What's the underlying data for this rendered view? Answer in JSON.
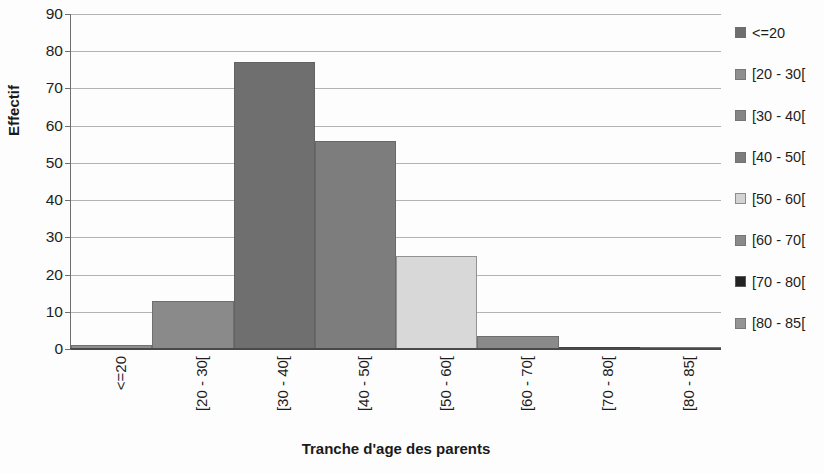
{
  "chart_data": {
    "type": "bar",
    "title": "",
    "xlabel": "Tranche d'age des parents",
    "ylabel": "Effectif",
    "categories": [
      "<=20",
      "[20 - 30[",
      "[30 - 40[",
      "[40 - 50[",
      "[50 - 60[",
      "[60 - 70[",
      "[70 - 80[",
      "[80 - 85["
    ],
    "values": [
      1,
      13,
      77,
      56,
      25,
      3.5,
      0.5,
      0
    ],
    "ylim": [
      0,
      90
    ],
    "ytick_labels": [
      "90",
      "80",
      "70",
      "60",
      "50",
      "40",
      "30",
      "20",
      "10",
      "0"
    ],
    "ytick_values": [
      90,
      80,
      70,
      60,
      50,
      40,
      30,
      20,
      10,
      0
    ],
    "ytick_step": 10,
    "grid": true,
    "grid_axis": "y",
    "legend_position": "right",
    "bar_gap": 0,
    "series": [
      {
        "name": "Effectif",
        "values": [
          1,
          13,
          77,
          56,
          25,
          3.5,
          0.5,
          0
        ],
        "colors": [
          "#8f8f8f",
          "#8a8a8a",
          "#6f6f6f",
          "#7d7d7d",
          "#d8d8d8",
          "#8a8a8a",
          "#2b2b2b",
          "#9a9a9a"
        ]
      }
    ],
    "legend": [
      {
        "label": "<=20",
        "color": "#6e6e6e"
      },
      {
        "label": "[20 - 30[",
        "color": "#8f8f8f"
      },
      {
        "label": "[30 - 40[",
        "color": "#858585"
      },
      {
        "label": "[40 - 50[",
        "color": "#7c7c7c"
      },
      {
        "label": "[50 - 60[",
        "color": "#d3d3d3"
      },
      {
        "label": "[60 - 70[",
        "color": "#8a8a8a"
      },
      {
        "label": "[70 - 80[",
        "color": "#232323"
      },
      {
        "label": "[80 - 85[",
        "color": "#949494"
      }
    ]
  }
}
